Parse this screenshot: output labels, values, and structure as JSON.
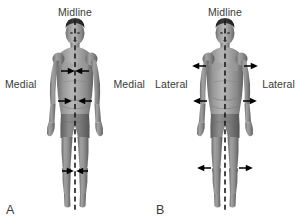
{
  "figure": {
    "background_color": "#ffffff",
    "text_color": "#3a3a3a",
    "midline_color": "#1a1a1a",
    "arrow_color": "#000000",
    "width": 300,
    "height": 221
  },
  "panels": [
    {
      "letter": "A",
      "midline_label": "Midline",
      "left_label": "Medial",
      "right_label": "Medial",
      "arrow_direction": "inward",
      "arrow_levels": [
        "chest",
        "waist",
        "knee"
      ]
    },
    {
      "letter": "B",
      "midline_label": "Midline",
      "left_label": "Lateral",
      "right_label": "Lateral",
      "arrow_direction": "outward",
      "arrow_levels": [
        "shoulder",
        "waist",
        "knee"
      ]
    }
  ],
  "icons": {
    "midline": "dashed-vertical-line-icon",
    "arrow_inward": "arrow-inward-icon",
    "arrow_outward": "arrow-outward-icon",
    "figure": "human-body-anterior-icon"
  }
}
